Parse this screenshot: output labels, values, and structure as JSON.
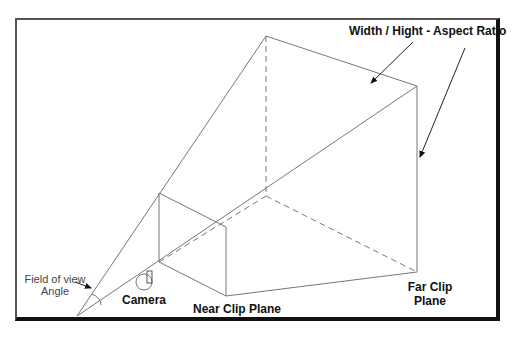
{
  "diagram": {
    "labels": {
      "aspect_ratio": "Width  /  Hight - Aspect Ratio",
      "far_clip_line1": "Far Clip",
      "far_clip_line2": "Plane",
      "near_clip": "Near Clip Plane",
      "camera": "Camera",
      "fov_line1": "Field of view",
      "fov_line2": "Angle"
    },
    "colors": {
      "line": "#777777",
      "text": "#111111",
      "frame": "#111111"
    }
  }
}
